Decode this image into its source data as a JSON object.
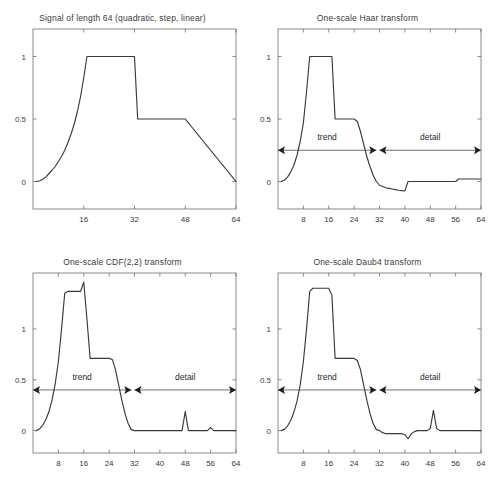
{
  "figure": {
    "name": "wavelet-transform-figure",
    "width": 490,
    "height": 487,
    "background": "#ffffff",
    "line_color": "#3a3a3a",
    "axis_color": "#6f6f6f"
  },
  "panels": [
    {
      "id": "signal",
      "title": "Signal of length 64 (quadratic, step, linear)",
      "position": "top-left"
    },
    {
      "id": "haar",
      "title": "One-scale Haar transform",
      "position": "top-right"
    },
    {
      "id": "cdf22",
      "title": "One-scale CDF(2,2) transform",
      "position": "bottom-left"
    },
    {
      "id": "daub4",
      "title": "One-scale Daub4 transform",
      "position": "bottom-right"
    }
  ],
  "annotations": {
    "trend_label": "trend",
    "detail_label": "detail"
  },
  "chart_data": [
    {
      "type": "line",
      "id": "signal",
      "title": "Signal of length 64 (quadratic, step, linear)",
      "xlabel": "",
      "ylabel": "",
      "xlim": [
        0,
        64
      ],
      "ylim": [
        -0.22,
        1.22
      ],
      "grid": false,
      "legend": null,
      "xticks": [
        16,
        32,
        48,
        64
      ],
      "xticklabels": [
        "16",
        "32",
        "48",
        "64"
      ],
      "yticks": [
        0,
        0.5,
        1
      ],
      "yticklabels": [
        "0",
        "0.5",
        "1"
      ],
      "annotations": [],
      "series": [
        {
          "name": "signal",
          "x": [
            1,
            2,
            3,
            4,
            5,
            6,
            7,
            8,
            9,
            10,
            11,
            12,
            13,
            14,
            15,
            16,
            17,
            18,
            19,
            20,
            21,
            22,
            23,
            24,
            25,
            26,
            27,
            28,
            29,
            30,
            31,
            32,
            33,
            34,
            35,
            36,
            37,
            38,
            39,
            40,
            41,
            42,
            43,
            44,
            45,
            46,
            47,
            48,
            49,
            50,
            51,
            52,
            53,
            54,
            55,
            56,
            57,
            58,
            59,
            60,
            61,
            62,
            63,
            64
          ],
          "y": [
            0.0,
            0.004,
            0.016,
            0.035,
            0.062,
            0.09,
            0.12,
            0.16,
            0.2,
            0.25,
            0.31,
            0.38,
            0.46,
            0.56,
            0.68,
            0.83,
            1.0,
            1.0,
            1.0,
            1.0,
            1.0,
            1.0,
            1.0,
            1.0,
            1.0,
            1.0,
            1.0,
            1.0,
            1.0,
            1.0,
            1.0,
            1.0,
            0.5,
            0.5,
            0.5,
            0.5,
            0.5,
            0.5,
            0.5,
            0.5,
            0.5,
            0.5,
            0.5,
            0.5,
            0.5,
            0.5,
            0.5,
            0.5,
            0.469,
            0.438,
            0.406,
            0.375,
            0.344,
            0.312,
            0.281,
            0.25,
            0.219,
            0.188,
            0.156,
            0.125,
            0.094,
            0.062,
            0.031,
            0.0
          ]
        }
      ]
    },
    {
      "type": "line",
      "id": "haar",
      "title": "One-scale Haar transform",
      "xlabel": "",
      "ylabel": "",
      "xlim": [
        0,
        64
      ],
      "ylim": [
        -0.22,
        1.22
      ],
      "grid": false,
      "legend": null,
      "xticks": [
        8,
        16,
        24,
        32,
        40,
        48,
        56,
        64
      ],
      "xticklabels": [
        "8",
        "16",
        "24",
        "32",
        "40",
        "48",
        "56",
        "64"
      ],
      "yticks": [
        0,
        0.5,
        1
      ],
      "yticklabels": [
        "0",
        "0.5",
        "1"
      ],
      "annotations": [
        {
          "label": "trend",
          "x_start": 0,
          "x_end": 31,
          "y": 0.25
        },
        {
          "label": "detail",
          "x_start": 32,
          "x_end": 64,
          "y": 0.25
        }
      ],
      "series": [
        {
          "name": "haar-transform",
          "x": [
            1,
            2,
            3,
            4,
            5,
            6,
            7,
            8,
            9,
            10,
            11,
            12,
            13,
            14,
            15,
            16,
            17,
            18,
            19,
            20,
            21,
            22,
            23,
            24,
            25,
            26,
            27,
            28,
            29,
            30,
            31,
            32,
            33,
            34,
            35,
            36,
            37,
            38,
            39,
            40,
            41,
            42,
            43,
            44,
            45,
            46,
            47,
            48,
            49,
            50,
            51,
            52,
            53,
            54,
            55,
            56,
            57,
            58,
            59,
            60,
            61,
            62,
            63,
            64
          ],
          "y": [
            0.0,
            0.01,
            0.035,
            0.075,
            0.13,
            0.21,
            0.32,
            0.47,
            0.72,
            1.0,
            1.0,
            1.0,
            1.0,
            1.0,
            1.0,
            1.0,
            1.0,
            0.5,
            0.5,
            0.5,
            0.5,
            0.5,
            0.5,
            0.5,
            0.48,
            0.4,
            0.3,
            0.2,
            0.12,
            0.05,
            0.0,
            -0.03,
            -0.04,
            -0.05,
            -0.055,
            -0.06,
            -0.065,
            -0.07,
            -0.073,
            -0.075,
            0.0,
            0.0,
            0.0,
            0.0,
            0.0,
            0.0,
            0.0,
            0.0,
            0.0,
            0.0,
            0.0,
            0.0,
            0.0,
            0.0,
            0.0,
            0.0,
            0.02,
            0.02,
            0.02,
            0.02,
            0.02,
            0.02,
            0.02,
            0.02
          ]
        }
      ]
    },
    {
      "type": "line",
      "id": "cdf22",
      "title": "One-scale CDF(2,2) transform",
      "xlabel": "",
      "ylabel": "",
      "xlim": [
        0,
        64
      ],
      "ylim": [
        -0.22,
        1.55
      ],
      "grid": false,
      "legend": null,
      "xticks": [
        8,
        16,
        24,
        32,
        40,
        48,
        56,
        64
      ],
      "xticklabels": [
        "8",
        "16",
        "24",
        "32",
        "40",
        "48",
        "56",
        "64"
      ],
      "yticks": [
        0,
        0.5,
        1
      ],
      "yticklabels": [
        "0",
        "0.5",
        "1"
      ],
      "annotations": [
        {
          "label": "trend",
          "x_start": 0,
          "x_end": 31,
          "y": 0.4
        },
        {
          "label": "detail",
          "x_start": 32,
          "x_end": 64,
          "y": 0.4
        }
      ],
      "series": [
        {
          "name": "cdf22-transform",
          "x": [
            1,
            2,
            3,
            4,
            5,
            6,
            7,
            8,
            9,
            10,
            11,
            12,
            13,
            14,
            15,
            16,
            17,
            18,
            19,
            20,
            21,
            22,
            23,
            24,
            25,
            26,
            27,
            28,
            29,
            30,
            31,
            32,
            33,
            34,
            35,
            36,
            37,
            38,
            39,
            40,
            41,
            42,
            43,
            44,
            45,
            46,
            47,
            48,
            49,
            50,
            51,
            52,
            53,
            54,
            55,
            56,
            57,
            58,
            59,
            60,
            61,
            62,
            63,
            64
          ],
          "y": [
            0.0,
            0.015,
            0.05,
            0.105,
            0.185,
            0.3,
            0.46,
            0.68,
            1.0,
            1.35,
            1.37,
            1.37,
            1.37,
            1.37,
            1.37,
            1.46,
            1.1,
            0.71,
            0.71,
            0.71,
            0.71,
            0.71,
            0.71,
            0.71,
            0.7,
            0.6,
            0.45,
            0.3,
            0.17,
            0.07,
            0.01,
            0.0,
            0.0,
            0.0,
            0.0,
            0.0,
            0.0,
            0.0,
            0.0,
            0.0,
            0.0,
            0.0,
            0.0,
            0.0,
            0.0,
            0.0,
            0.0,
            0.19,
            0.0,
            0.0,
            0.0,
            0.0,
            0.0,
            0.0,
            0.0,
            0.03,
            0.0,
            0.0,
            0.0,
            0.0,
            0.0,
            0.0,
            0.0,
            0.0
          ]
        }
      ]
    },
    {
      "type": "line",
      "id": "daub4",
      "title": "One-scale Daub4 transform",
      "xlabel": "",
      "ylabel": "",
      "xlim": [
        0,
        64
      ],
      "ylim": [
        -0.22,
        1.55
      ],
      "grid": false,
      "legend": null,
      "xticks": [
        8,
        16,
        24,
        32,
        40,
        48,
        56,
        64
      ],
      "xticklabels": [
        "8",
        "16",
        "24",
        "32",
        "40",
        "48",
        "56",
        "64"
      ],
      "yticks": [
        0,
        0.5,
        1
      ],
      "yticklabels": [
        "0",
        "0.5",
        "1"
      ],
      "annotations": [
        {
          "label": "trend",
          "x_start": 0,
          "x_end": 31,
          "y": 0.4
        },
        {
          "label": "detail",
          "x_start": 32,
          "x_end": 64,
          "y": 0.4
        }
      ],
      "series": [
        {
          "name": "daub4-transform",
          "x": [
            1,
            2,
            3,
            4,
            5,
            6,
            7,
            8,
            9,
            10,
            11,
            12,
            13,
            14,
            15,
            16,
            17,
            18,
            19,
            20,
            21,
            22,
            23,
            24,
            25,
            26,
            27,
            28,
            29,
            30,
            31,
            32,
            33,
            34,
            35,
            36,
            37,
            38,
            39,
            40,
            41,
            42,
            43,
            44,
            45,
            46,
            47,
            48,
            49,
            50,
            51,
            52,
            53,
            54,
            55,
            56,
            57,
            58,
            59,
            60,
            61,
            62,
            63,
            64
          ],
          "y": [
            0.0,
            0.012,
            0.045,
            0.1,
            0.18,
            0.29,
            0.45,
            0.68,
            1.0,
            1.37,
            1.4,
            1.4,
            1.4,
            1.4,
            1.4,
            1.4,
            1.33,
            0.71,
            0.71,
            0.71,
            0.71,
            0.71,
            0.71,
            0.71,
            0.69,
            0.6,
            0.45,
            0.3,
            0.17,
            0.07,
            0.01,
            0.0,
            -0.02,
            -0.03,
            -0.03,
            -0.03,
            -0.03,
            -0.03,
            -0.03,
            -0.04,
            -0.08,
            -0.03,
            -0.01,
            0.0,
            0.0,
            0.0,
            0.0,
            0.02,
            0.2,
            0.02,
            0.0,
            0.0,
            0.0,
            0.0,
            0.0,
            0.0,
            0.0,
            0.0,
            0.0,
            0.0,
            0.0,
            0.0,
            0.0,
            0.0
          ]
        }
      ]
    }
  ]
}
